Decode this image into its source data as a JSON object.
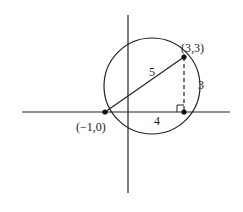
{
  "diagram": {
    "title": "",
    "points": [
      {
        "id": "A",
        "label": "(−1,0)",
        "coords": [
          -1,
          0
        ]
      },
      {
        "id": "B",
        "label": "(3,3)",
        "coords": [
          3,
          3
        ]
      },
      {
        "id": "C",
        "label": "",
        "coords": [
          3,
          0
        ]
      }
    ],
    "segments": [
      {
        "from": "A",
        "to": "B",
        "label": "5",
        "style": "solid"
      },
      {
        "from": "B",
        "to": "C",
        "label": "3",
        "style": "dashed"
      },
      {
        "from": "A",
        "to": "C",
        "label": "4",
        "style": "none"
      }
    ],
    "circle": {
      "description": "circle through (−1,0) and (3,3)"
    },
    "right_angle_marker": "at (3,0)",
    "colors": {
      "stroke": "#222222",
      "background": "#ffffff"
    }
  }
}
